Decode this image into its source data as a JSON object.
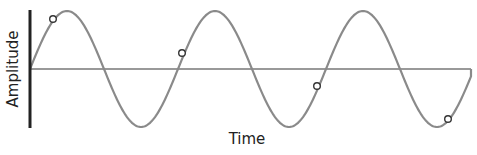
{
  "diagram": {
    "type": "sine-wave",
    "xlabel": "Time",
    "ylabel": "Amplitude",
    "colors": {
      "wave": "#8a8a8a",
      "axis": "#222222",
      "baseline": "#777777",
      "marker": "#333333"
    },
    "geometry": {
      "origin_x": 30,
      "baseline_y": 69,
      "amplitude_px": 58,
      "period_px": 148,
      "end_x": 471,
      "axis_top": 10,
      "axis_bottom": 128
    },
    "markers": [
      {
        "x": 53,
        "y": 19
      },
      {
        "x": 182,
        "y": 53
      },
      {
        "x": 317,
        "y": 86
      },
      {
        "x": 448,
        "y": 119
      }
    ]
  }
}
